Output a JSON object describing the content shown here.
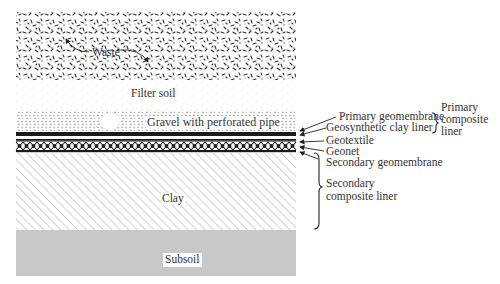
{
  "diagram": {
    "type": "landfill liner cross-section",
    "layers": [
      {
        "name": "waste",
        "label": "Waste",
        "top": 12,
        "bottom": 80
      },
      {
        "name": "filter-soil",
        "label": "Filter soil",
        "top": 80,
        "bottom": 110
      },
      {
        "name": "gravel",
        "label": "Gravel with perforated pipe",
        "top": 110,
        "bottom": 132
      },
      {
        "name": "primary-geomembrane",
        "label": "Primary geomembrane",
        "top": 132,
        "bottom": 136
      },
      {
        "name": "geonet",
        "label": "Geonet",
        "top": 139,
        "bottom": 152
      },
      {
        "name": "clay",
        "label": "Clay",
        "top": 153,
        "bottom": 230
      },
      {
        "name": "subsoil",
        "label": "Subsoil",
        "top": 230,
        "bottom": 276
      }
    ],
    "callouts": [
      {
        "label": "Primary geomembrane"
      },
      {
        "label": "Geosynthetic clay liner"
      },
      {
        "label": "Geotextile"
      },
      {
        "label": "Geonet"
      },
      {
        "label": "Secondary geomembrane"
      }
    ],
    "groups": {
      "primary": {
        "line1": "Primary",
        "line2": "composite",
        "line3": "liner"
      },
      "secondary": {
        "line1": "Secondary",
        "line2": "composite liner"
      }
    },
    "colors": {
      "subsoil": "#c8c8c8",
      "ink": "#222222",
      "hatch": "#9a9a9a"
    }
  }
}
